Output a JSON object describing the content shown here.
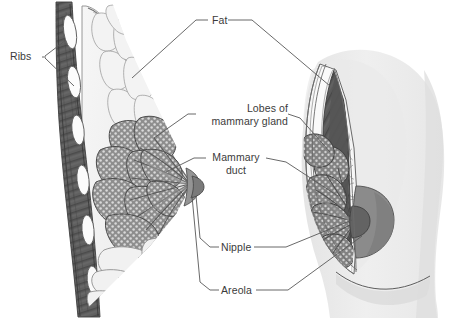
{
  "figure": {
    "kind": "anatomical-illustration",
    "background_color": "#ffffff",
    "label_color": "#3b3b3b",
    "leader_color": "#555555",
    "palette": {
      "skin_light": "#eeeeee",
      "skin_shadow": "#dcdcdc",
      "fat_lobule_fill": "#f2f2f2",
      "fat_lobule_stroke": "#9a9a9a",
      "gland_fill": "#8e8e8e",
      "gland_stipple": "#d8d8d8",
      "gland_stroke": "#4a4a4a",
      "muscle_dark": "#5e5e5e",
      "muscle_darker": "#4a4a4a",
      "rib_white": "#fbfbfb",
      "areola_gray": "#8a8a8a",
      "nipple_dark": "#6f6f6f",
      "outline": "#3a3a3a"
    }
  },
  "labels": [
    {
      "id": "ribs",
      "text": "Ribs",
      "x": 10,
      "y": 51,
      "align": "left",
      "lines": 1
    },
    {
      "id": "fat",
      "text": "Fat",
      "x": 213,
      "y": 14,
      "align": "left",
      "lines": 1
    },
    {
      "id": "lobes",
      "text_line1": "Lobes of",
      "text_line2": "mammary gland",
      "x": 196,
      "y": 104,
      "align": "right",
      "lines": 2
    },
    {
      "id": "duct",
      "text_line1": "Mammary",
      "text_line2": "duct",
      "x": 209,
      "y": 152,
      "align": "center",
      "lines": 2
    },
    {
      "id": "nipple",
      "text": "Nipple",
      "x": 221,
      "y": 241,
      "align": "left",
      "lines": 1
    },
    {
      "id": "areola",
      "text": "Areola",
      "x": 221,
      "y": 284,
      "align": "left",
      "lines": 1
    }
  ],
  "label_text": {
    "ribs": "Ribs",
    "fat": "Fat",
    "lobes_line1": "Lobes of",
    "lobes_line2": "mammary gland",
    "duct_line1": "Mammary",
    "duct_line2": "duct",
    "nipple": "Nipple",
    "areola": "Areola"
  },
  "structures": {
    "left_view": "sagittal section showing ribs, pectoral muscle, subcutaneous fat lobules, lobes of mammary gland, ducts converging at nipple",
    "right_view": "anterior view with wedge cutaway showing fat, gland lobes, ducts, areola and nipple on torso silhouette"
  }
}
